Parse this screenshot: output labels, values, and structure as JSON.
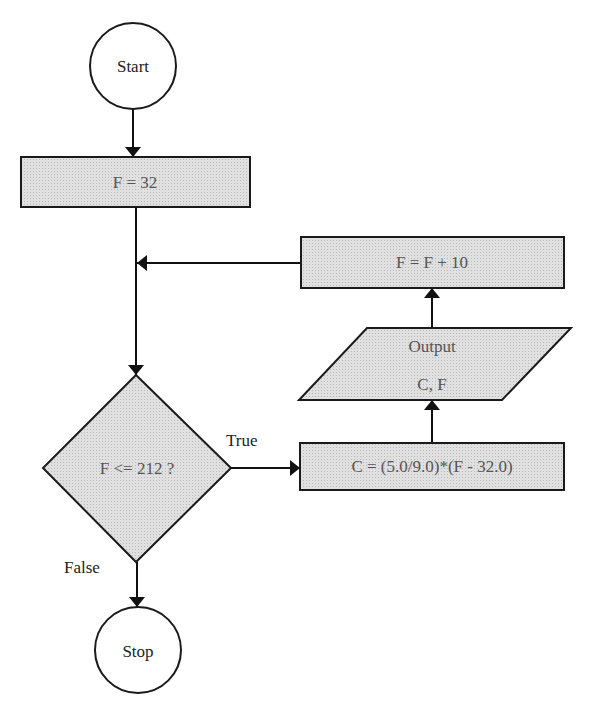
{
  "diagram": {
    "type": "flowchart",
    "nodes": {
      "start": {
        "shape": "circle",
        "label": "Start"
      },
      "init": {
        "shape": "process",
        "label": "F = 32"
      },
      "decision": {
        "shape": "decision",
        "label": "F <= 212 ?"
      },
      "compute": {
        "shape": "process",
        "label": "C = (5.0/9.0)*(F - 32.0)"
      },
      "output": {
        "shape": "io",
        "label_line1": "Output",
        "label_line2": "C, F"
      },
      "increment": {
        "shape": "process",
        "label": "F = F + 10"
      },
      "stop": {
        "shape": "circle",
        "label": "Stop"
      }
    },
    "edges": {
      "true_label": "True",
      "false_label": "False"
    },
    "colors": {
      "fill": "#d9d9d9",
      "stroke": "#1a1a1a",
      "background": "#ffffff"
    }
  }
}
